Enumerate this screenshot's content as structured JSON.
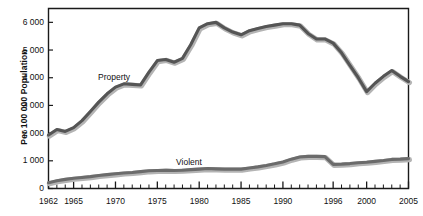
{
  "chart_data": {
    "type": "line",
    "title": "",
    "xlabel": "",
    "ylabel": "Per 100 000 Population",
    "xlim": [
      1962,
      2005
    ],
    "ylim": [
      0,
      6500
    ],
    "yticks": [
      0,
      1000,
      2000,
      3000,
      4000,
      5000,
      6000
    ],
    "ytick_labels": [
      "0",
      "1 000",
      "2 000",
      "3 000",
      "4 000",
      "5 000",
      "6 000"
    ],
    "xticks": [
      1962,
      1965,
      1970,
      1975,
      1980,
      1985,
      1990,
      1996,
      2000,
      2005
    ],
    "xtick_labels": [
      "1962",
      "1965",
      "1970",
      "1975",
      "1980",
      "1985",
      "1990",
      "1996",
      "2000",
      "2005"
    ],
    "minor_xticks_every": 1,
    "grid": false,
    "legend": "inline-labels",
    "x": [
      1962,
      1963,
      1964,
      1965,
      1966,
      1967,
      1968,
      1969,
      1970,
      1971,
      1972,
      1973,
      1974,
      1975,
      1976,
      1977,
      1978,
      1979,
      1980,
      1981,
      1982,
      1983,
      1984,
      1985,
      1986,
      1987,
      1988,
      1989,
      1990,
      1991,
      1992,
      1993,
      1994,
      1995,
      1996,
      1997,
      1998,
      1999,
      2000,
      2001,
      2002,
      2003,
      2004,
      2005
    ],
    "series": [
      {
        "name": "Property",
        "label": "Property",
        "color": "#555555",
        "values": [
          1930,
          2130,
          2060,
          2200,
          2450,
          2780,
          3120,
          3420,
          3660,
          3780,
          3760,
          3740,
          4200,
          4620,
          4660,
          4560,
          4700,
          5200,
          5800,
          5950,
          6000,
          5800,
          5650,
          5550,
          5700,
          5780,
          5850,
          5900,
          5950,
          5950,
          5900,
          5600,
          5400,
          5400,
          5250,
          4900,
          4450,
          4000,
          3500,
          3800,
          4050,
          4260,
          4050,
          3860
        ]
      },
      {
        "name": "Violent",
        "label": "Violent",
        "color": "#6b6b6b",
        "values": [
          210,
          280,
          330,
          370,
          400,
          430,
          470,
          500,
          530,
          560,
          580,
          610,
          640,
          650,
          660,
          650,
          660,
          680,
          700,
          720,
          710,
          700,
          700,
          700,
          740,
          780,
          830,
          890,
          960,
          1060,
          1140,
          1160,
          1160,
          1150,
          870,
          880,
          900,
          930,
          950,
          980,
          1010,
          1050,
          1060,
          1080
        ]
      }
    ],
    "series_label_positions": [
      {
        "name": "Property",
        "x_px": 98,
        "y_px": 72
      },
      {
        "name": "Violent",
        "x_px": 176,
        "y_px": 157
      }
    ]
  }
}
